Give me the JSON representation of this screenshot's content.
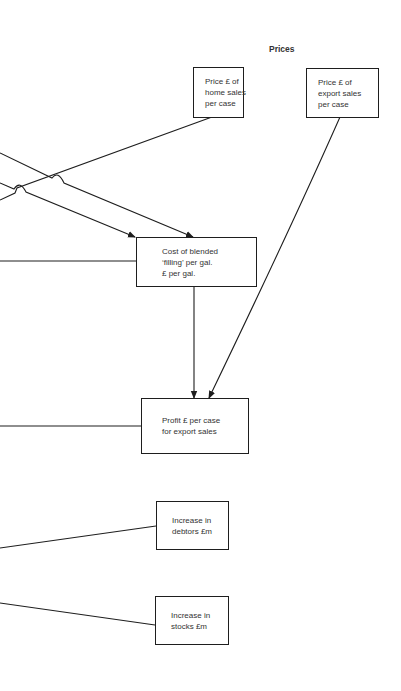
{
  "section_title": "Prices",
  "nodes": {
    "home_price": {
      "lines": [
        "Price £ of",
        "home sales",
        "per case"
      ]
    },
    "export_price": {
      "lines": [
        "Price £ of",
        "export sales",
        "per case"
      ]
    },
    "blend_cost": {
      "lines": [
        "Cost of blended",
        "‘filling’ per gal.",
        "£ per gal."
      ]
    },
    "export_profit": {
      "lines": [
        "Profit £ per case",
        "for export sales"
      ]
    },
    "debtors": {
      "lines": [
        "Increase in",
        "debtors £m"
      ]
    },
    "stocks": {
      "lines": [
        "Increase in",
        "stocks £m"
      ]
    }
  },
  "colors": {
    "line": "#1e1e1e",
    "background": "#ffffff",
    "text": "#333333"
  }
}
